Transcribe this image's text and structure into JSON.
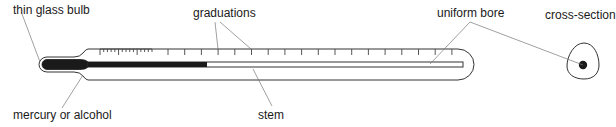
{
  "diagram": {
    "labels": {
      "bulb": "thin glass bulb",
      "graduations": "graduations",
      "bore": "uniform bore",
      "cross_section": "cross-section",
      "liquid": "mercury or alcohol",
      "stem": "stem"
    },
    "colors": {
      "outline": "#333333",
      "liquid": "#1a1a1a",
      "leader": "#666666",
      "text": "#1a1a1a"
    },
    "graduations": {
      "fine_ticks_count": 14,
      "major_ticks_count": 18
    }
  }
}
